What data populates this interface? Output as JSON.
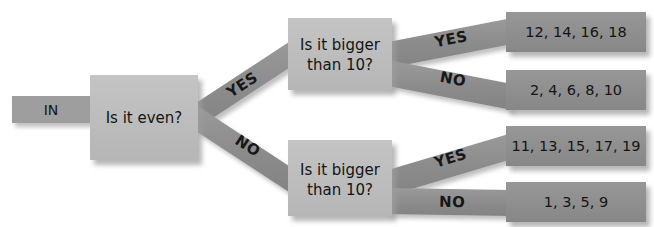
{
  "diagram": {
    "type": "flowchart",
    "colors": {
      "background": "#ffffff",
      "decision_box_fill": "#bdbdbd",
      "decision_box_edge": "#a8a8a8",
      "band_fill": "#8e8e8e",
      "output_box_fill": "#8e8e8e",
      "in_box_fill": "#9e9e9e",
      "shadow": "#c9c9c9",
      "text": "#141414"
    },
    "input": {
      "label": "IN"
    },
    "decisions": [
      {
        "id": "root",
        "line1": "Is it even?",
        "line2": ""
      },
      {
        "id": "even-branch",
        "line1": "Is it bigger",
        "line2": "than 10?"
      },
      {
        "id": "odd-branch",
        "line1": "Is it bigger",
        "line2": "than 10?"
      }
    ],
    "branch_labels": {
      "root_yes": "YES",
      "root_no": "NO",
      "even_yes": "YES",
      "even_no": "NO",
      "odd_yes": "YES",
      "odd_no": "NO"
    },
    "outputs": [
      {
        "id": "even-gt10",
        "label": "12, 14, 16, 18"
      },
      {
        "id": "even-le10",
        "label": "2, 4, 6, 8, 10"
      },
      {
        "id": "odd-gt10",
        "label": "11, 13, 15, 17, 19"
      },
      {
        "id": "odd-le10",
        "label": "1, 3, 5, 9"
      }
    ]
  }
}
